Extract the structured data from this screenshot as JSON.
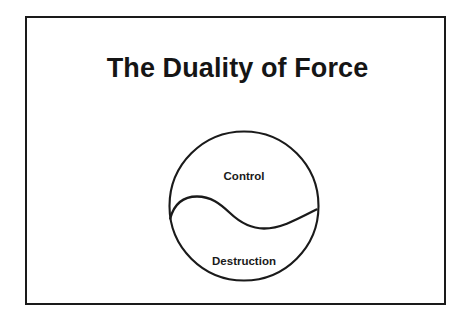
{
  "slide": {
    "title": "The Duality of Force",
    "background_color": "#ffffff",
    "border_color": "#1a1a1a",
    "text_color": "#151515"
  },
  "diagram": {
    "name": "duality-circle",
    "shape": "circle-divided-by-s-curve",
    "stroke_color": "#1a1a1a",
    "upper_region_label": "Control",
    "lower_region_label": "Destruction"
  }
}
